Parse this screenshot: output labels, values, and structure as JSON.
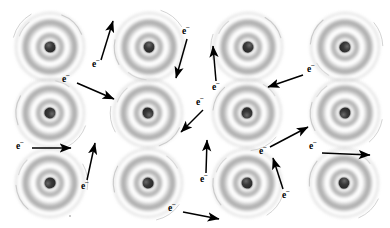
{
  "figure": {
    "background_color": "#ffffff",
    "width": 390,
    "height": 228,
    "electron_label": "e",
    "electron_charge_sup": "−",
    "ink_color": "#000000",
    "shell_color": "#9a9a9a",
    "nucleus_color": "#2b2b2b"
  },
  "lattice": {
    "rows": 3,
    "columns": 4,
    "atom_count": 12,
    "shell_count": 3,
    "outer_radius": 31,
    "nucleus_radius": 5,
    "atoms": [
      {
        "id": "atom-r1c1",
        "row": 1,
        "col": 1,
        "cx": 50,
        "cy": 47
      },
      {
        "id": "atom-r1c2",
        "row": 1,
        "col": 2,
        "cx": 149,
        "cy": 47
      },
      {
        "id": "atom-r1c3",
        "row": 1,
        "col": 3,
        "cx": 248,
        "cy": 47
      },
      {
        "id": "atom-r1c4",
        "row": 1,
        "col": 4,
        "cx": 345,
        "cy": 47
      },
      {
        "id": "atom-r2c1",
        "row": 2,
        "col": 1,
        "cx": 50,
        "cy": 113
      },
      {
        "id": "atom-r2c2",
        "row": 2,
        "col": 2,
        "cx": 148,
        "cy": 113
      },
      {
        "id": "atom-r2c3",
        "row": 2,
        "col": 3,
        "cx": 247,
        "cy": 113
      },
      {
        "id": "atom-r2c4",
        "row": 2,
        "col": 4,
        "cx": 345,
        "cy": 113
      },
      {
        "id": "atom-r3c1",
        "row": 3,
        "col": 1,
        "cx": 50,
        "cy": 183
      },
      {
        "id": "atom-r3c2",
        "row": 3,
        "col": 2,
        "cx": 148,
        "cy": 183
      },
      {
        "id": "atom-r3c3",
        "row": 3,
        "col": 3,
        "cx": 247,
        "cy": 183
      },
      {
        "id": "atom-r3c4",
        "row": 3,
        "col": 4,
        "cx": 344,
        "cy": 183
      }
    ]
  },
  "electrons": [
    {
      "id": "electron-1",
      "label": "e",
      "sup": "−",
      "lx": 96,
      "ly": 65,
      "arrow": {
        "x1": 101,
        "y1": 60,
        "x2": 113,
        "y2": 21
      },
      "direction": "up-right"
    },
    {
      "id": "electron-2",
      "label": "e",
      "sup": "−",
      "lx": 186,
      "ly": 32,
      "arrow": {
        "x1": 187,
        "y1": 39,
        "x2": 176,
        "y2": 78
      },
      "direction": "down-left"
    },
    {
      "id": "electron-3",
      "label": "e",
      "sup": "−",
      "lx": 66,
      "ly": 80,
      "arrow": {
        "x1": 77,
        "y1": 83,
        "x2": 114,
        "y2": 99
      },
      "direction": "down-right"
    },
    {
      "id": "electron-4",
      "label": "e",
      "sup": "−",
      "lx": 216,
      "ly": 88,
      "arrow": {
        "x1": 216,
        "y1": 81,
        "x2": 213,
        "y2": 46
      },
      "direction": "up"
    },
    {
      "id": "electron-5",
      "label": "e",
      "sup": "−",
      "lx": 311,
      "ly": 70,
      "arrow": {
        "x1": 303,
        "y1": 75,
        "x2": 268,
        "y2": 87
      },
      "direction": "left-down"
    },
    {
      "id": "electron-6",
      "label": "e",
      "sup": "−",
      "lx": 200,
      "ly": 103,
      "arrow": {
        "x1": 203,
        "y1": 110,
        "x2": 181,
        "y2": 132
      },
      "direction": "down-left"
    },
    {
      "id": "electron-7",
      "label": "e",
      "sup": "−",
      "lx": 20,
      "ly": 147,
      "arrow": {
        "x1": 32,
        "y1": 148,
        "x2": 71,
        "y2": 148
      },
      "direction": "right"
    },
    {
      "id": "electron-8",
      "label": "e",
      "sup": "−",
      "lx": 85,
      "ly": 187,
      "arrow": {
        "x1": 87,
        "y1": 180,
        "x2": 95,
        "y2": 143
      },
      "direction": "up-right"
    },
    {
      "id": "electron-9",
      "label": "e",
      "sup": "−",
      "lx": 204,
      "ly": 180,
      "arrow": {
        "x1": 206,
        "y1": 173,
        "x2": 207,
        "y2": 140
      },
      "direction": "up"
    },
    {
      "id": "electron-10",
      "label": "e",
      "sup": "−",
      "lx": 263,
      "ly": 152,
      "arrow": {
        "x1": 270,
        "y1": 147,
        "x2": 308,
        "y2": 127
      },
      "direction": "up-right"
    },
    {
      "id": "electron-11",
      "label": "e",
      "sup": "−",
      "lx": 313,
      "ly": 147,
      "arrow": {
        "x1": 322,
        "y1": 153,
        "x2": 370,
        "y2": 155
      },
      "direction": "right"
    },
    {
      "id": "electron-12",
      "label": "e",
      "sup": "−",
      "lx": 286,
      "ly": 196,
      "arrow": {
        "x1": 283,
        "y1": 189,
        "x2": 273,
        "y2": 158
      },
      "direction": "up-left"
    },
    {
      "id": "electron-13",
      "label": "e",
      "sup": "−",
      "lx": 172,
      "ly": 209,
      "arrow": {
        "x1": 183,
        "y1": 212,
        "x2": 219,
        "y2": 219
      },
      "direction": "right-down"
    }
  ]
}
